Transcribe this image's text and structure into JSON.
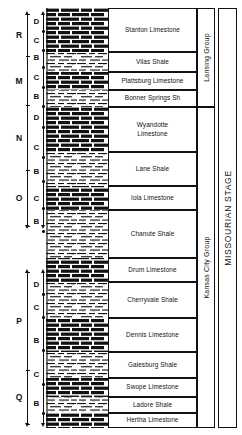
{
  "figure": {
    "kind": "stratigraphic-column"
  },
  "cycles": {
    "outer": [
      {
        "label": "R",
        "top": 14,
        "bottom": 56
      },
      {
        "label": "M",
        "top": 56,
        "bottom": 105
      },
      {
        "label": "N",
        "top": 105,
        "bottom": 170
      },
      {
        "label": "O",
        "top": 170,
        "bottom": 226
      },
      {
        "label": "P",
        "top": 272,
        "bottom": 370
      },
      {
        "label": "Q",
        "top": 370,
        "bottom": 424
      }
    ],
    "inner": [
      {
        "label": "D",
        "center": 22
      },
      {
        "label": "C",
        "center": 41
      },
      {
        "label": "B",
        "center": 58
      },
      {
        "label": "C",
        "center": 78
      },
      {
        "label": "B",
        "center": 97
      },
      {
        "label": "D",
        "center": 118
      },
      {
        "label": "C",
        "center": 148
      },
      {
        "label": "B",
        "center": 172
      },
      {
        "label": "C",
        "center": 199
      },
      {
        "label": "B",
        "center": 222
      },
      {
        "label": "D",
        "center": 285
      },
      {
        "label": "C",
        "center": 308
      },
      {
        "label": "B",
        "center": 341
      },
      {
        "label": "C",
        "center": 375
      },
      {
        "label": "B",
        "center": 404
      }
    ]
  },
  "formations": [
    {
      "name": "Stanton Limestone",
      "top": 8,
      "bottom": 52,
      "lithology": "limestone"
    },
    {
      "name": "Vilas Shale",
      "top": 52,
      "bottom": 72,
      "lithology": "shale"
    },
    {
      "name": "Plattsburg Limestone",
      "top": 72,
      "bottom": 90,
      "lithology": "limestone"
    },
    {
      "name": "Bonner Springs Sh",
      "top": 90,
      "bottom": 107,
      "lithology": "shale"
    },
    {
      "name": "Wyandotte Limestone",
      "top": 107,
      "bottom": 152,
      "lithology": "limestone"
    },
    {
      "name": "Lane Shale",
      "top": 152,
      "bottom": 186,
      "lithology": "shale"
    },
    {
      "name": "Iola Limestone",
      "top": 186,
      "bottom": 210,
      "lithology": "limestone"
    },
    {
      "name": "Chanute Shale",
      "top": 210,
      "bottom": 258,
      "lithology": "shale"
    },
    {
      "name": "Drum Limestone",
      "top": 258,
      "bottom": 282,
      "lithology": "limestone"
    },
    {
      "name": "Cherryvale Shale",
      "top": 282,
      "bottom": 318,
      "lithology": "shale"
    },
    {
      "name": "Dennis Limestone",
      "top": 318,
      "bottom": 352,
      "lithology": "limestone"
    },
    {
      "name": "Galesburg Shale",
      "top": 352,
      "bottom": 378,
      "lithology": "shale"
    },
    {
      "name": "Swope Limestone",
      "top": 378,
      "bottom": 397,
      "lithology": "limestone"
    },
    {
      "name": "Ladore Shale",
      "top": 397,
      "bottom": 413,
      "lithology": "shale"
    },
    {
      "name": "Hertha Limestone",
      "top": 413,
      "bottom": 428,
      "lithology": "limestone"
    }
  ],
  "groups": [
    {
      "name": "Lansing Group",
      "top": 8,
      "bottom": 107
    },
    {
      "name": "Kansas City Group",
      "top": 107,
      "bottom": 428
    }
  ],
  "stage": {
    "name": "MISSOURIAN STAGE",
    "top": 8,
    "bottom": 428
  },
  "colors": {
    "ink": "#111111",
    "paper": "#ffffff"
  }
}
